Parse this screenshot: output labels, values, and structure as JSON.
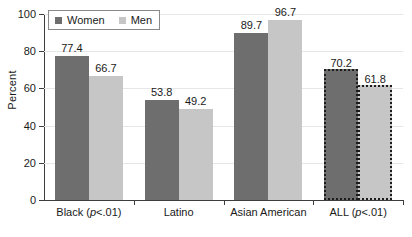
{
  "chart_data": {
    "type": "bar",
    "title": "",
    "xlabel": "",
    "ylabel": "Percent",
    "ylim": [
      0,
      100
    ],
    "yticks": [
      0,
      20,
      40,
      60,
      80,
      100
    ],
    "grid": true,
    "legend_position": "top-left",
    "categories": [
      "Black (p<.01)",
      "Latino",
      "Asian American",
      "ALL (p<.01)"
    ],
    "category_parts": [
      {
        "main": "Black (",
        "italic": "p",
        "tail": "<.01)"
      },
      {
        "main": "Latino",
        "italic": "",
        "tail": ""
      },
      {
        "main": "Asian American",
        "italic": "",
        "tail": ""
      },
      {
        "main": "ALL (",
        "italic": "p",
        "tail": "<.01)"
      }
    ],
    "series": [
      {
        "name": "Women",
        "color": "#6e6e6e",
        "values": [
          77.4,
          53.8,
          89.7,
          70.2
        ]
      },
      {
        "name": "Men",
        "color": "#c6c6c6",
        "values": [
          66.7,
          49.2,
          96.7,
          61.8
        ]
      }
    ],
    "highlighted_group": "ALL (p<.01)",
    "highlight_style": "dotted-outline"
  },
  "legend": {
    "items": [
      {
        "label": "Women",
        "color": "#6e6e6e"
      },
      {
        "label": "Men",
        "color": "#c6c6c6"
      }
    ]
  },
  "axis": {
    "y_label": "Percent",
    "y_ticks": [
      "0",
      "20",
      "40",
      "60",
      "80",
      "100"
    ]
  }
}
